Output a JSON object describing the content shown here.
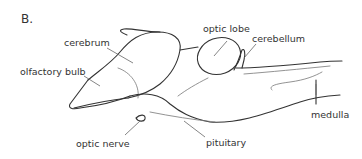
{
  "figure": {
    "panel_label": "B.",
    "labels": {
      "cerebrum": "cerebrum",
      "olfactory_bulb": "olfactory bulb",
      "optic_lobe": "optic lobe",
      "cerebellum": "cerebellum",
      "medulla": "medulla",
      "optic_nerve": "optic nerve",
      "pituitary": "pituitary"
    },
    "colors": {
      "outline": "#333333",
      "leader": "#666666",
      "text": "#333333",
      "background": "#ffffff"
    }
  }
}
